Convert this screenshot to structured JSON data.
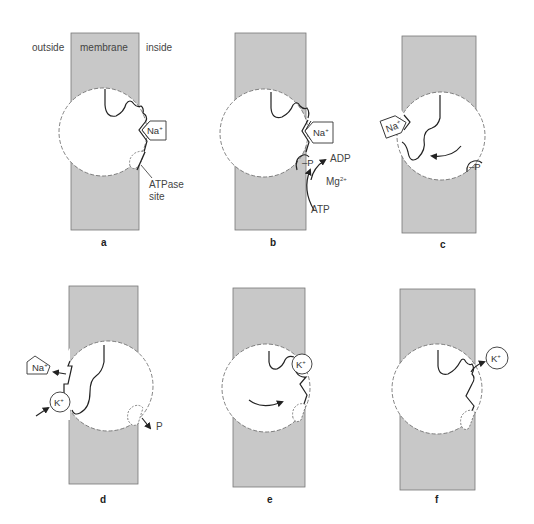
{
  "figure": {
    "colors": {
      "membrane_fill": "#c8c8c8",
      "membrane_edge": "#6a6a6a",
      "stroke": "#2a2a2a",
      "background": "#ffffff"
    },
    "region_labels": {
      "outside": "outside",
      "membrane": "membrane",
      "inside": "inside"
    },
    "panels": [
      {
        "id": "a",
        "label": "a",
        "ions": [
          {
            "name": "Na",
            "charge": "+"
          }
        ],
        "annotations": [
          "ATPase",
          "site"
        ]
      },
      {
        "id": "b",
        "label": "b",
        "ions": [
          {
            "name": "Na",
            "charge": "+"
          }
        ],
        "annotations": [
          "–P",
          "ADP",
          "Mg",
          "2+",
          "ATP"
        ]
      },
      {
        "id": "c",
        "label": "c",
        "ions": [
          {
            "name": "Na",
            "charge": "+"
          }
        ],
        "annotations": [
          "–P"
        ]
      },
      {
        "id": "d",
        "label": "d",
        "ions": [
          {
            "name": "Na",
            "charge": "+"
          },
          {
            "name": "K",
            "charge": "+"
          }
        ],
        "annotations": [
          "P"
        ]
      },
      {
        "id": "e",
        "label": "e",
        "ions": [
          {
            "name": "K",
            "charge": "+"
          }
        ],
        "annotations": []
      },
      {
        "id": "f",
        "label": "f",
        "ions": [
          {
            "name": "K",
            "charge": "+"
          }
        ],
        "annotations": []
      }
    ]
  }
}
